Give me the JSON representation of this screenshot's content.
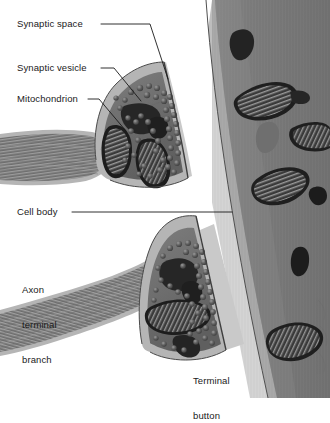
{
  "figure": {
    "kind": "biology-diagram",
    "background_color": "#ffffff",
    "text_color": "#1a1a1a",
    "width": 330,
    "height": 398
  },
  "labels": {
    "synaptic_space": "Synaptic space",
    "synaptic_vesicle": "Synaptic vesicle",
    "mitochondrion": "Mitochondrion",
    "cell_body": "Cell body",
    "axon_terminal_branch": "Axon\nterminal\nbranch",
    "axon_terminal_branch_lines": [
      "Axon",
      "terminal",
      "branch"
    ],
    "terminal_button": "Terminal\nbutton",
    "terminal_button_lines": [
      "Terminal",
      "button"
    ]
  },
  "leader_lines": [
    {
      "name": "synaptic-space-leader",
      "from": [
        101,
        24
      ],
      "to": [
        168,
        79
      ],
      "bend": [
        150,
        24
      ]
    },
    {
      "name": "synaptic-vesicle-leader",
      "from": [
        101,
        68
      ],
      "to": [
        141,
        101
      ],
      "bend": [
        114,
        68
      ]
    },
    {
      "name": "mitochondrion-leader",
      "from": [
        88,
        99
      ],
      "to": [
        126,
        131
      ],
      "bend": [
        99,
        99
      ]
    },
    {
      "name": "cell-body-leader",
      "from": [
        72,
        212
      ],
      "to": [
        232,
        212
      ],
      "bend": null
    }
  ],
  "structures": {
    "presynaptic": {
      "name": "axon terminal branch with terminal button",
      "count": 2,
      "membrane_color": "#b9b9b9",
      "membrane_edge_color": "#4d4d4d",
      "cytoplasm_color": "#6f6f6f",
      "axon_striation_color": "#8c8c8c",
      "vesicle_color": "#575757",
      "vesicle_highlight_color": "#8a8a8a",
      "mitochondrion_color": "#2b2b2b",
      "mitochondrion_cristae_color": "#9a9a9a"
    },
    "synaptic_cleft": {
      "name": "synaptic space / cleft",
      "color": "#c6c6c6"
    },
    "postsynaptic": {
      "name": "cell body of postsynaptic neuron",
      "cytoplasm_color": "#7a7a7a",
      "membrane_color": "#bdbdbd",
      "mitochondria_count": 7,
      "mitochondrion_dark_color": "#242424",
      "mitochondrion_cristae_color": "#8f8f8f"
    }
  }
}
